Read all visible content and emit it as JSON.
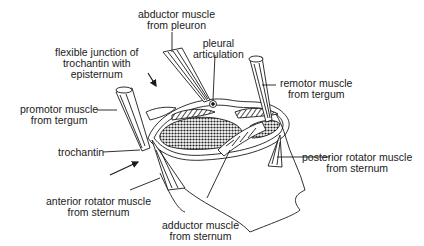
{
  "diagram": {
    "colors": {
      "ink": "#1a1a1a",
      "background": "#ffffff",
      "stipple": "#2a2a2a"
    },
    "labels": {
      "abductor_pleuron": "abductor muscle\nfrom pleuron",
      "pleural_articulation": "pleural\narticulation",
      "flexible_junction": "flexible junction of\ntrochantin with\nepisternum",
      "remotor": "remotor muscle\nfrom tergum",
      "promotor": "promotor muscle\nfrom tergum",
      "trochantin": "trochantin",
      "posterior_rotator": "posterior rotator muscle\nfrom sternum",
      "anterior_rotator": "anterior rotator muscle\nfrom sternum",
      "adductor_sternum": "adductor muscle\nfrom sternum"
    }
  }
}
